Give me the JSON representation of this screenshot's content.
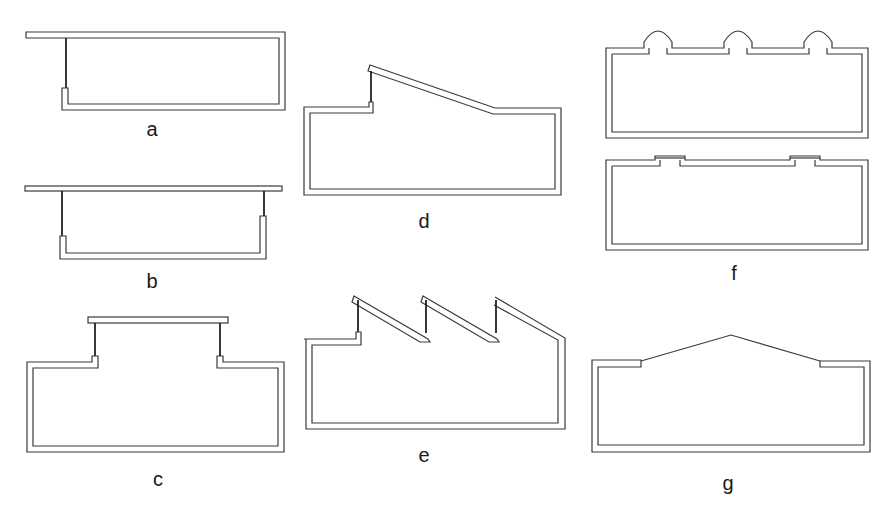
{
  "figure": {
    "type": "architectural-section-diagrams",
    "panels": [
      {
        "id": "a",
        "label": "a",
        "description": "Single-sided clerestory with overhanging flat roof"
      },
      {
        "id": "b",
        "label": "b",
        "description": "Double-sided clerestory with overhanging flat roof"
      },
      {
        "id": "c",
        "label": "c",
        "description": "Raised central monitor roof with glazing on both sides"
      },
      {
        "id": "d",
        "label": "d",
        "description": "Single sloped roof with clerestory at high side"
      },
      {
        "id": "e",
        "label": "e",
        "description": "Sawtooth roof with three vertical glazed openings"
      },
      {
        "id": "f",
        "label": "f",
        "description": "Domed skylights (top) and flat skylights (bottom)"
      },
      {
        "id": "g",
        "label": "g",
        "description": "Pitched glazed roof (gable skylight)"
      }
    ],
    "colors": {
      "line": "#3a3a3a",
      "glass": "#222222",
      "background": "#ffffff"
    }
  }
}
